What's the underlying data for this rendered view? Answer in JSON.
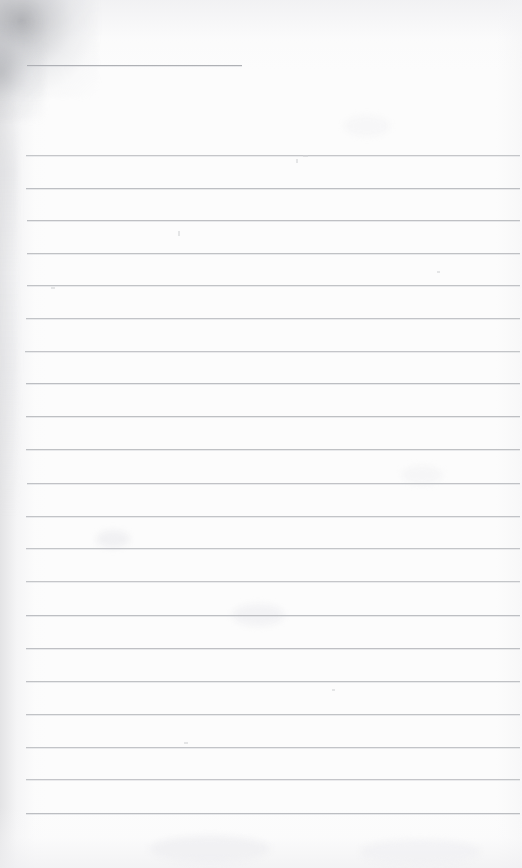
{
  "document": {
    "kind": "scanned-lined-paper",
    "title": "Blank ruled notebook page (scan)",
    "page_width": 522,
    "page_height": 868,
    "paper_color": "#fcfcfc",
    "rule_color": "#b9bbbf",
    "smudge_color": "#7a7c82",
    "body_text": "",
    "header_blank_label": "",
    "lines_total": 22
  },
  "rules": {
    "short_rule": {
      "name": "header-blank-rule",
      "x": 27,
      "y": 65,
      "width": 215,
      "label": ""
    },
    "body_rules": [
      {
        "x": 26,
        "y": 155,
        "width": 494,
        "text": ""
      },
      {
        "x": 26,
        "y": 188,
        "width": 494,
        "text": ""
      },
      {
        "x": 27,
        "y": 220,
        "width": 493,
        "text": ""
      },
      {
        "x": 27,
        "y": 253,
        "width": 493,
        "text": ""
      },
      {
        "x": 27,
        "y": 285,
        "width": 493,
        "text": ""
      },
      {
        "x": 26,
        "y": 318,
        "width": 494,
        "text": ""
      },
      {
        "x": 25,
        "y": 351,
        "width": 495,
        "text": ""
      },
      {
        "x": 26,
        "y": 383,
        "width": 494,
        "text": ""
      },
      {
        "x": 26,
        "y": 416,
        "width": 494,
        "text": ""
      },
      {
        "x": 26,
        "y": 449,
        "width": 494,
        "text": ""
      },
      {
        "x": 27,
        "y": 483,
        "width": 493,
        "text": ""
      },
      {
        "x": 26,
        "y": 516,
        "width": 494,
        "text": ""
      },
      {
        "x": 26,
        "y": 548,
        "width": 494,
        "text": ""
      },
      {
        "x": 26,
        "y": 581,
        "width": 494,
        "text": ""
      },
      {
        "x": 26,
        "y": 615,
        "width": 494,
        "text": ""
      },
      {
        "x": 26,
        "y": 648,
        "width": 494,
        "text": ""
      },
      {
        "x": 26,
        "y": 681,
        "width": 494,
        "text": ""
      },
      {
        "x": 26,
        "y": 714,
        "width": 494,
        "text": ""
      },
      {
        "x": 26,
        "y": 747,
        "width": 494,
        "text": ""
      },
      {
        "x": 26,
        "y": 779,
        "width": 494,
        "text": ""
      },
      {
        "x": 26,
        "y": 813,
        "width": 494,
        "text": ""
      }
    ]
  },
  "artifacts": {
    "specks": [
      {
        "x": 296,
        "y": 159,
        "w": 2,
        "h": 4
      },
      {
        "x": 303,
        "y": 155,
        "w": 5,
        "h": 2
      },
      {
        "x": 178,
        "y": 231,
        "w": 2,
        "h": 5
      },
      {
        "x": 437,
        "y": 271,
        "w": 3,
        "h": 2
      },
      {
        "x": 51,
        "y": 287,
        "w": 4,
        "h": 2
      },
      {
        "x": 332,
        "y": 689,
        "w": 3,
        "h": 2
      },
      {
        "x": 184,
        "y": 742,
        "w": 4,
        "h": 2
      }
    ],
    "blotches": [
      {
        "x": 96,
        "y": 530,
        "w": 34,
        "h": 18,
        "color": "rgba(238,238,240,0.75)"
      },
      {
        "x": 232,
        "y": 604,
        "w": 52,
        "h": 22,
        "color": "rgba(240,240,242,0.70)"
      },
      {
        "x": 344,
        "y": 116,
        "w": 46,
        "h": 20,
        "color": "rgba(243,243,245,0.60)"
      },
      {
        "x": 402,
        "y": 466,
        "w": 40,
        "h": 18,
        "color": "rgba(242,242,244,0.60)"
      },
      {
        "x": 150,
        "y": 836,
        "w": 120,
        "h": 26,
        "color": "rgba(238,238,241,0.70)"
      },
      {
        "x": 360,
        "y": 840,
        "w": 120,
        "h": 24,
        "color": "rgba(239,239,242,0.65)"
      }
    ]
  }
}
